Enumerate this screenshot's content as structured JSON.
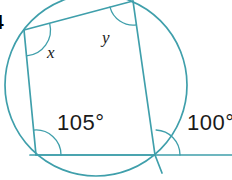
{
  "figure": {
    "number_label": "4",
    "stroke_color": "#3f9fab",
    "text_color": "#1a1a1a",
    "background": "#ffffff",
    "width": 232,
    "height": 180
  },
  "labels": {
    "angle_x": "x",
    "angle_y": "y",
    "angle_105": "105°",
    "angle_100": "100°"
  },
  "geometry": {
    "circle": {
      "cx": 96,
      "cy": 85,
      "r": 91
    },
    "quadrilateral": {
      "vertices": [
        {
          "name": "top-left",
          "x": 24,
          "y": 30
        },
        {
          "name": "top-right",
          "x": 133,
          "y": 1
        },
        {
          "name": "bottom-right",
          "x": 155,
          "y": 155
        },
        {
          "name": "bottom-left",
          "x": 36,
          "y": 155
        }
      ]
    },
    "tangent_line": {
      "x1": 30,
      "y1": 155,
      "x2": 232,
      "y2": 155
    },
    "extended_side": {
      "x1": 133,
      "y1": 1,
      "x2": 162,
      "y2": 172
    },
    "angle_arcs": [
      {
        "at": "top-left",
        "radius": 26,
        "label": "x"
      },
      {
        "at": "top-right",
        "radius": 24,
        "label": "y"
      },
      {
        "at": "bottom-left",
        "radius": 25,
        "label": "105°"
      },
      {
        "at": "bottom-right",
        "radius": 25,
        "label": "100°"
      }
    ]
  }
}
